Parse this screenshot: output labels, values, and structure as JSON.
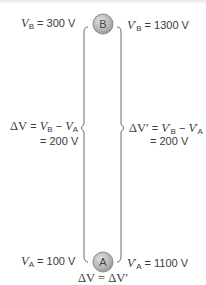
{
  "diagram": {
    "charges": [
      {
        "label": "B",
        "position": "top"
      },
      {
        "label": "A",
        "position": "bottom"
      }
    ],
    "left": {
      "vb_symbol": "V",
      "vb_sub": "B",
      "vb_value": "= 300 V",
      "va_symbol": "V",
      "va_sub": "A",
      "va_value": "= 100 V",
      "delta_line1_prefix": "ΔV",
      "delta_line1_eq": " = ",
      "delta_line1_vb": "V",
      "delta_line1_vb_sub": "B",
      "delta_line1_minus": " − ",
      "delta_line1_va": "V",
      "delta_line1_va_sub": "A",
      "delta_line2": "= 200 V"
    },
    "right": {
      "vb_symbol": "V",
      "vb_prime": "′",
      "vb_sub": "B",
      "vb_value": "=  1300 V",
      "va_symbol": "V",
      "va_prime": "′",
      "va_sub": "A",
      "va_value": "= 1100 V",
      "delta_line1_prefix": "ΔV′",
      "delta_line1_eq": " = ",
      "delta_line1_vb": "V",
      "delta_line1_vb_prime": "′",
      "delta_line1_vb_sub": "B",
      "delta_line1_minus": " − ",
      "delta_line1_va": "V",
      "delta_line1_va_prime": "′",
      "delta_line1_va_sub": "A",
      "delta_line2": "= 200 V"
    },
    "conclusion": "ΔV = ΔV′",
    "colors": {
      "line": "#6a6a6a",
      "charge_fill": "#b9b9b9",
      "charge_stroke": "#8a8a8a",
      "text": "#3a3a3a"
    }
  }
}
